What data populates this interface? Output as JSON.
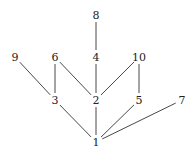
{
  "diagram": {
    "type": "hasse-diagram",
    "nodes": [
      {
        "id": "1",
        "label": "1",
        "x": 96,
        "y": 142
      },
      {
        "id": "2",
        "label": "2",
        "x": 96,
        "y": 100
      },
      {
        "id": "3",
        "label": "3",
        "x": 55,
        "y": 100
      },
      {
        "id": "4",
        "label": "4",
        "x": 96,
        "y": 57
      },
      {
        "id": "5",
        "label": "5",
        "x": 139,
        "y": 100
      },
      {
        "id": "6",
        "label": "6",
        "x": 55,
        "y": 57
      },
      {
        "id": "7",
        "label": "7",
        "x": 182,
        "y": 100
      },
      {
        "id": "8",
        "label": "8",
        "x": 96,
        "y": 15
      },
      {
        "id": "9",
        "label": "9",
        "x": 15,
        "y": 57
      },
      {
        "id": "10",
        "label": "10",
        "x": 139,
        "y": 57
      }
    ],
    "edges": [
      [
        "1",
        "2"
      ],
      [
        "1",
        "3"
      ],
      [
        "1",
        "5"
      ],
      [
        "1",
        "7"
      ],
      [
        "2",
        "4"
      ],
      [
        "2",
        "6"
      ],
      [
        "2",
        "10"
      ],
      [
        "3",
        "6"
      ],
      [
        "3",
        "9"
      ],
      [
        "4",
        "8"
      ],
      [
        "5",
        "10"
      ]
    ]
  }
}
